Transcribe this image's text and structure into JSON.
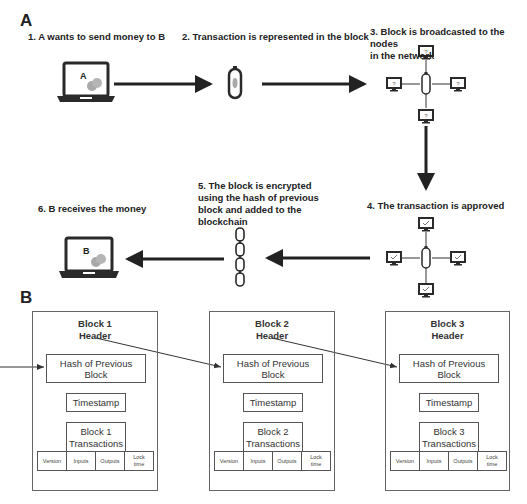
{
  "panel_a": {
    "label": "A",
    "steps": [
      {
        "number": 1,
        "text": "1. A wants to send money to B"
      },
      {
        "number": 2,
        "text": "2. Transaction is represented in the block"
      },
      {
        "number": 3,
        "line1": "3. Block is broadcasted to the nodes",
        "line2": "in the network"
      },
      {
        "number": 4,
        "text": "4. The transaction is approved"
      },
      {
        "number": 5,
        "line1": "5. The block is encrypted",
        "line2": "using the hash of previous",
        "line3": "block and added to the",
        "line4": "blockchain"
      },
      {
        "number": 6,
        "text": "6. B receives the money"
      }
    ],
    "sender_laptop_label": "A",
    "receiver_laptop_label": "B",
    "broadcast_node_glyph": "?",
    "approved_node_glyph": "✓"
  },
  "panel_b": {
    "label": "B",
    "blocks": [
      {
        "title_line1": "Block 1",
        "title_line2": "Header",
        "hash": "Hash of Previous Block",
        "timestamp": "Timestamp",
        "tx_line1": "Block 1",
        "tx_line2": "Transactions",
        "fields": {
          "version": "Version",
          "inputs": "Inputs",
          "outputs": "Outputs",
          "lock1": "Lock",
          "lock2": "time"
        }
      },
      {
        "title_line1": "Block 2",
        "title_line2": "Header",
        "hash": "Hash of Previous Block",
        "timestamp": "Timestamp",
        "tx_line1": "Block 2",
        "tx_line2": "Transactions",
        "fields": {
          "version": "Version",
          "inputs": "Inputs",
          "outputs": "Outputs",
          "lock1": "Lock",
          "lock2": "time"
        }
      },
      {
        "title_line1": "Block 3",
        "title_line2": "Header",
        "hash": "Hash of Previous Block",
        "timestamp": "Timestamp",
        "tx_line1": "Block 3",
        "tx_line2": "Transactions",
        "fields": {
          "version": "Version",
          "inputs": "Inputs",
          "outputs": "Outputs",
          "lock1": "Lock",
          "lock2": "time"
        }
      }
    ]
  },
  "colors": {
    "ink": "#222222",
    "coin": "#a8a8a8",
    "border": "#555555"
  }
}
